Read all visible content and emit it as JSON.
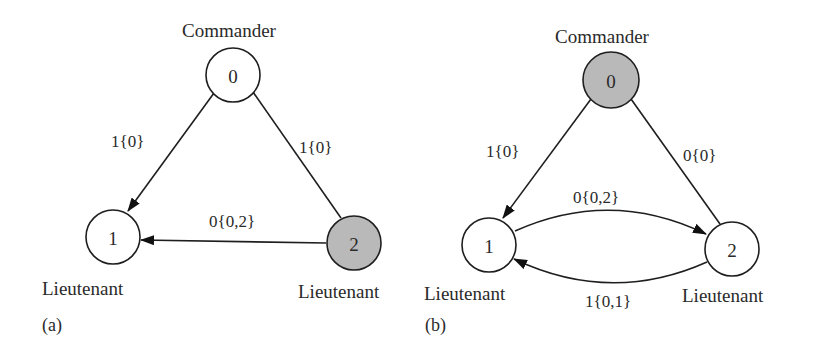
{
  "figure": {
    "colors": {
      "faulty_fill": "#b9b9b9",
      "normal_fill": "#ffffff",
      "stroke": "#1e1e1e",
      "text": "#2a2a2a"
    },
    "panels": [
      {
        "label": "(a)",
        "nodes": [
          {
            "id": "0",
            "role": "Commander",
            "faulty": false
          },
          {
            "id": "1",
            "role": "Lieutenant",
            "faulty": false
          },
          {
            "id": "2",
            "role": "Lieutenant",
            "faulty": true
          }
        ],
        "edges": [
          {
            "from": "0",
            "to": "1",
            "label": "1{0}",
            "directed": true
          },
          {
            "from": "0",
            "to": "2",
            "label": "1{0}",
            "directed": false
          },
          {
            "from": "2",
            "to": "1",
            "label": "0{0,2}",
            "directed": true
          }
        ]
      },
      {
        "label": "(b)",
        "nodes": [
          {
            "id": "0",
            "role": "Commander",
            "faulty": true
          },
          {
            "id": "1",
            "role": "Lieutenant",
            "faulty": false
          },
          {
            "id": "2",
            "role": "Lieutenant",
            "faulty": false
          }
        ],
        "edges": [
          {
            "from": "0",
            "to": "1",
            "label": "1{0}",
            "directed": true
          },
          {
            "from": "0",
            "to": "2",
            "label": "0{0}",
            "directed": false
          },
          {
            "from": "1",
            "to": "2",
            "label": "0{0,2}",
            "directed": true
          },
          {
            "from": "2",
            "to": "1",
            "label": "1{0,1}",
            "directed": true
          }
        ]
      }
    ]
  }
}
